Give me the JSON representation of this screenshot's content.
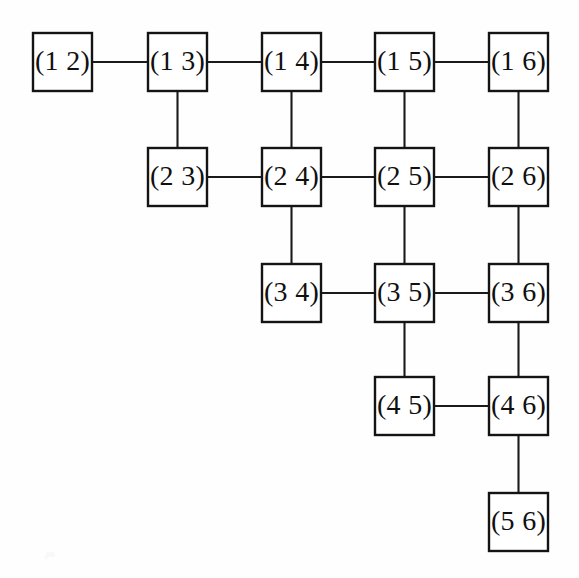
{
  "diagram": {
    "background_color": "#ffffff",
    "node_fill": "#ffffff",
    "node_stroke": "#141414",
    "edge_color": "#1a1a1a",
    "text_color": "#101010",
    "geometry": {
      "box_width": 59,
      "box_height": 58,
      "col_x": [
        33,
        148,
        262,
        375,
        489
      ],
      "row_y": [
        33,
        148,
        264,
        377,
        493
      ]
    },
    "nodes": [
      {
        "id": "n12",
        "label": "(1 2)",
        "col": 0,
        "row": 0
      },
      {
        "id": "n13",
        "label": "(1 3)",
        "col": 1,
        "row": 0
      },
      {
        "id": "n14",
        "label": "(1 4)",
        "col": 2,
        "row": 0
      },
      {
        "id": "n15",
        "label": "(1 5)",
        "col": 3,
        "row": 0
      },
      {
        "id": "n16",
        "label": "(1 6)",
        "col": 4,
        "row": 0
      },
      {
        "id": "n23",
        "label": "(2 3)",
        "col": 1,
        "row": 1
      },
      {
        "id": "n24",
        "label": "(2 4)",
        "col": 2,
        "row": 1
      },
      {
        "id": "n25",
        "label": "(2 5)",
        "col": 3,
        "row": 1
      },
      {
        "id": "n26",
        "label": "(2 6)",
        "col": 4,
        "row": 1
      },
      {
        "id": "n34",
        "label": "(3 4)",
        "col": 2,
        "row": 2
      },
      {
        "id": "n35",
        "label": "(3 5)",
        "col": 3,
        "row": 2
      },
      {
        "id": "n36",
        "label": "(3 6)",
        "col": 4,
        "row": 2
      },
      {
        "id": "n45",
        "label": "(4 5)",
        "col": 3,
        "row": 3
      },
      {
        "id": "n46",
        "label": "(4 6)",
        "col": 4,
        "row": 3
      },
      {
        "id": "n56",
        "label": "(5 6)",
        "col": 4,
        "row": 4
      }
    ],
    "edges": [
      {
        "from": "n12",
        "to": "n13",
        "orientation": "horizontal"
      },
      {
        "from": "n13",
        "to": "n14",
        "orientation": "horizontal"
      },
      {
        "from": "n14",
        "to": "n15",
        "orientation": "horizontal"
      },
      {
        "from": "n15",
        "to": "n16",
        "orientation": "horizontal"
      },
      {
        "from": "n23",
        "to": "n24",
        "orientation": "horizontal"
      },
      {
        "from": "n24",
        "to": "n25",
        "orientation": "horizontal"
      },
      {
        "from": "n25",
        "to": "n26",
        "orientation": "horizontal"
      },
      {
        "from": "n34",
        "to": "n35",
        "orientation": "horizontal"
      },
      {
        "from": "n35",
        "to": "n36",
        "orientation": "horizontal"
      },
      {
        "from": "n45",
        "to": "n46",
        "orientation": "horizontal"
      },
      {
        "from": "n13",
        "to": "n23",
        "orientation": "vertical"
      },
      {
        "from": "n14",
        "to": "n24",
        "orientation": "vertical"
      },
      {
        "from": "n15",
        "to": "n25",
        "orientation": "vertical"
      },
      {
        "from": "n16",
        "to": "n26",
        "orientation": "vertical"
      },
      {
        "from": "n24",
        "to": "n34",
        "orientation": "vertical"
      },
      {
        "from": "n25",
        "to": "n35",
        "orientation": "vertical"
      },
      {
        "from": "n26",
        "to": "n36",
        "orientation": "vertical"
      },
      {
        "from": "n35",
        "to": "n45",
        "orientation": "vertical"
      },
      {
        "from": "n36",
        "to": "n46",
        "orientation": "vertical"
      },
      {
        "from": "n46",
        "to": "n56",
        "orientation": "vertical"
      }
    ]
  }
}
